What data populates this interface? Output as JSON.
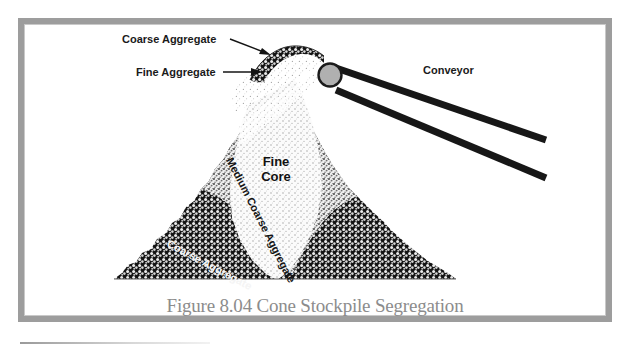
{
  "figure": {
    "caption": "Figure 8.04  Cone Stockpile Segregation",
    "frame_color": "#9d9d9d",
    "background_color": "#ffffff",
    "ink_color": "#171717",
    "pulley_color": "#b0b0b0"
  },
  "labels": {
    "coarse_aggregate_top": "Coarse Aggregate",
    "fine_aggregate_top": "Fine Aggregate",
    "conveyor": "Conveyor",
    "fine_core_line1": "Fine",
    "fine_core_line2": "Core",
    "medium_coarse_aggregate": "Medium Coarse Aggregate",
    "coarse_aggregate_pile": "Coarse Aggregate"
  },
  "diagram_data": {
    "type": "diagram",
    "subject": "Cone stockpile segregation from a conveyor discharge",
    "zones": [
      {
        "name": "Fine Core",
        "shade": "light stipple",
        "position": "central vertical wedge"
      },
      {
        "name": "Medium Coarse Aggregate",
        "shade": "medium stipple",
        "position": "flanking bands either side of core"
      },
      {
        "name": "Coarse Aggregate",
        "shade": "dark coarse stipple",
        "position": "outer slopes of the cone"
      }
    ],
    "flow": [
      {
        "name": "Coarse Aggregate",
        "description": "chunky particles arcing off conveyor head pulley"
      },
      {
        "name": "Fine Aggregate",
        "description": "fine fan falling beneath the coarse stream"
      }
    ],
    "equipment": [
      {
        "name": "Conveyor",
        "description": "inclined belt with head pulley discharging onto pile apex"
      }
    ]
  }
}
